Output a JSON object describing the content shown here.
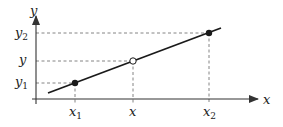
{
  "diagram": {
    "axes": {
      "x_label": "x",
      "y_label": "y"
    },
    "x_ticks": [
      {
        "base": "x",
        "sub": "1",
        "px": 75
      },
      {
        "base": "x",
        "sub": "",
        "px": 133
      },
      {
        "base": "x",
        "sub": "2",
        "px": 209
      }
    ],
    "y_ticks": [
      {
        "base": "y",
        "sub": "2",
        "py": 33
      },
      {
        "base": "y",
        "sub": "",
        "py": 61
      },
      {
        "base": "y",
        "sub": "1",
        "py": 83
      }
    ],
    "points": [
      {
        "name": "(x1, y1)",
        "filled": true
      },
      {
        "name": "(x, y)",
        "filled": false
      },
      {
        "name": "(x2, y2)",
        "filled": true
      }
    ],
    "colors": {
      "line": "#1a1a1a",
      "axis": "#333333",
      "dashed": "#666666"
    }
  }
}
